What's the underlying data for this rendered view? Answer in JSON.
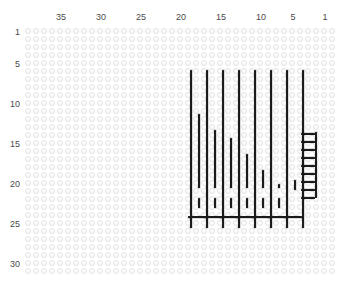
{
  "chart_data": {
    "type": "heatmap",
    "title": "",
    "xlabel": "",
    "ylabel": "",
    "grid": {
      "columns": 39,
      "rows": 31,
      "cell_px": 8,
      "ring_color": "#e3e3e3",
      "ring_fill": "#fbfbfb",
      "origin_left_px": 25,
      "origin_top_px": 28,
      "column_direction": "right-to-left",
      "row_direction": "top-to-bottom"
    },
    "axes": {
      "top_ticks": [
        {
          "label": "35",
          "column": 35,
          "x_px": 61
        },
        {
          "label": "30",
          "column": 30,
          "x_px": 101
        },
        {
          "label": "25",
          "column": 25,
          "x_px": 141
        },
        {
          "label": "20",
          "column": 20,
          "x_px": 181
        },
        {
          "label": "15",
          "column": 15,
          "x_px": 221
        },
        {
          "label": "10",
          "column": 10,
          "x_px": 261
        },
        {
          "label": "5",
          "column": 5,
          "x_px": 293
        },
        {
          "label": "1",
          "column": 1,
          "x_px": 325
        }
      ],
      "left_ticks": [
        {
          "label": "1",
          "row": 1,
          "y_px": 32
        },
        {
          "label": "5",
          "row": 5,
          "y_px": 64
        },
        {
          "label": "10",
          "row": 10,
          "y_px": 104
        },
        {
          "label": "15",
          "row": 15,
          "y_px": 144
        },
        {
          "label": "20",
          "row": 20,
          "y_px": 184
        },
        {
          "label": "25",
          "row": 25,
          "y_px": 224
        },
        {
          "label": "30",
          "row": 30,
          "y_px": 264
        }
      ],
      "left_label_x_px": 20,
      "mark_color": "#1a1a1a"
    },
    "marks": {
      "long_verticals": [
        {
          "name": "column-rail-1",
          "x_px": 165,
          "y_top_px": 42,
          "y_bottom_px": 200
        },
        {
          "name": "column-rail-2",
          "x_px": 181,
          "y_top_px": 42,
          "y_bottom_px": 200
        },
        {
          "name": "column-rail-3",
          "x_px": 197,
          "y_top_px": 42,
          "y_bottom_px": 200
        },
        {
          "name": "column-rail-4",
          "x_px": 213,
          "y_top_px": 42,
          "y_bottom_px": 200
        },
        {
          "name": "column-rail-5",
          "x_px": 229,
          "y_top_px": 42,
          "y_bottom_px": 200
        },
        {
          "name": "column-rail-6",
          "x_px": 245,
          "y_top_px": 42,
          "y_bottom_px": 200
        },
        {
          "name": "column-rail-7",
          "x_px": 261,
          "y_top_px": 42,
          "y_bottom_px": 200
        },
        {
          "name": "column-rail-8",
          "x_px": 277,
          "y_top_px": 42,
          "y_bottom_px": 200
        }
      ],
      "short_verticals": [
        {
          "name": "stair-bar-1",
          "x_px": 173,
          "y_top_px": 86,
          "y_bottom_px": 160
        },
        {
          "name": "stair-bar-2",
          "x_px": 189,
          "y_top_px": 102,
          "y_bottom_px": 160
        },
        {
          "name": "stair-bar-3",
          "x_px": 205,
          "y_top_px": 110,
          "y_bottom_px": 160
        },
        {
          "name": "stair-bar-4",
          "x_px": 221,
          "y_top_px": 126,
          "y_bottom_px": 160
        },
        {
          "name": "stair-bar-5",
          "x_px": 237,
          "y_top_px": 142,
          "y_bottom_px": 160
        },
        {
          "name": "stair-bar-6",
          "x_px": 253,
          "y_top_px": 156,
          "y_bottom_px": 160
        }
      ],
      "dash_verticals": [
        {
          "name": "dash-1",
          "x_px": 173,
          "y_top_px": 170,
          "y_bottom_px": 180
        },
        {
          "name": "dash-2",
          "x_px": 189,
          "y_top_px": 170,
          "y_bottom_px": 180
        },
        {
          "name": "dash-3",
          "x_px": 205,
          "y_top_px": 170,
          "y_bottom_px": 180
        },
        {
          "name": "dash-4",
          "x_px": 221,
          "y_top_px": 170,
          "y_bottom_px": 180
        },
        {
          "name": "dash-5",
          "x_px": 237,
          "y_top_px": 170,
          "y_bottom_px": 180
        },
        {
          "name": "dash-6",
          "x_px": 253,
          "y_top_px": 170,
          "y_bottom_px": 180
        },
        {
          "name": "dash-7",
          "x_px": 269,
          "y_top_px": 152,
          "y_bottom_px": 162
        }
      ],
      "ladder_rail": {
        "name": "ladder-rail",
        "x_px": 290,
        "y_top_px": 104,
        "y_bottom_px": 170
      },
      "ladder_rungs": [
        {
          "name": "ladder-rung-1",
          "x_left_px": 276,
          "x_right_px": 290,
          "y_px": 105
        },
        {
          "name": "ladder-rung-2",
          "x_left_px": 276,
          "x_right_px": 290,
          "y_px": 113
        },
        {
          "name": "ladder-rung-3",
          "x_left_px": 276,
          "x_right_px": 290,
          "y_px": 121
        },
        {
          "name": "ladder-rung-4",
          "x_left_px": 276,
          "x_right_px": 290,
          "y_px": 129
        },
        {
          "name": "ladder-rung-5",
          "x_left_px": 276,
          "x_right_px": 290,
          "y_px": 137
        },
        {
          "name": "ladder-rung-6",
          "x_left_px": 276,
          "x_right_px": 290,
          "y_px": 145
        },
        {
          "name": "ladder-rung-7",
          "x_left_px": 276,
          "x_right_px": 290,
          "y_px": 153
        },
        {
          "name": "ladder-rung-8",
          "x_left_px": 276,
          "x_right_px": 290,
          "y_px": 161
        },
        {
          "name": "ladder-rung-9",
          "x_left_px": 276,
          "x_right_px": 290,
          "y_px": 169
        }
      ],
      "base_ticks": [
        {
          "name": "base-tick-1",
          "x_left_px": 163,
          "x_right_px": 181,
          "y_px": 188
        },
        {
          "name": "base-tick-2",
          "x_left_px": 179,
          "x_right_px": 197,
          "y_px": 188
        },
        {
          "name": "base-tick-3",
          "x_left_px": 195,
          "x_right_px": 213,
          "y_px": 188
        },
        {
          "name": "base-tick-4",
          "x_left_px": 211,
          "x_right_px": 229,
          "y_px": 188
        },
        {
          "name": "base-tick-5",
          "x_left_px": 227,
          "x_right_px": 245,
          "y_px": 188
        },
        {
          "name": "base-tick-6",
          "x_left_px": 243,
          "x_right_px": 261,
          "y_px": 188
        },
        {
          "name": "base-tick-7",
          "x_left_px": 259,
          "x_right_px": 277,
          "y_px": 188
        }
      ]
    }
  }
}
